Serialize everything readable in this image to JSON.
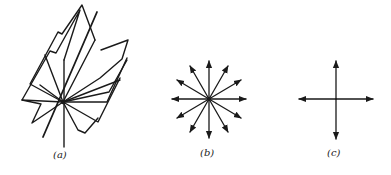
{
  "figures": [
    {
      "id": "a",
      "label": "(a)",
      "description": "pencil of planes through a common line"
    },
    {
      "id": "b",
      "label": "(b)",
      "description": "twelve arrows radiating from a point"
    },
    {
      "id": "c",
      "label": "(c)",
      "description": "four orthogonal arrows from a point"
    }
  ],
  "colors": {
    "stroke": "#1a1a1a",
    "background": "#ffffff"
  }
}
